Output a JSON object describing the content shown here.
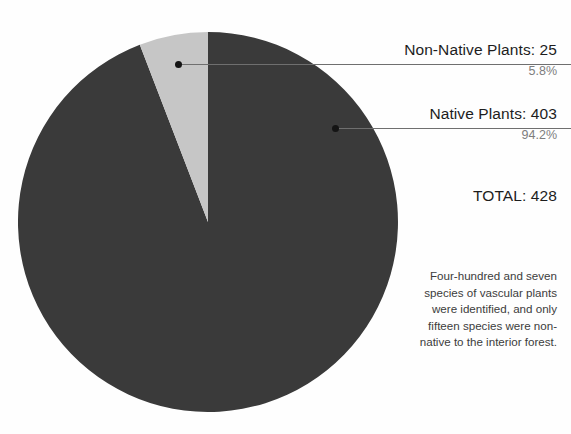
{
  "chart_data": {
    "type": "pie",
    "title": "",
    "categories": [
      "Non-Native Plants",
      "Native Plants"
    ],
    "values": [
      25,
      403
    ],
    "percentages": [
      "5.8%",
      "94.2%"
    ],
    "total": 428,
    "total_label": "TOTAL: 428",
    "colors": [
      "#c6c6c6",
      "#3a3a3a"
    ],
    "legend_position": "callout-right",
    "grid": false,
    "start_angle_deg": 0,
    "direction": "counterclockwise",
    "annotations": [
      "Four-hundred and seven species of vascular plants were identified, and only fifteen species were non-native to the interior forest."
    ],
    "slices": [
      {
        "label": "Non-Native Plants",
        "value": 25,
        "percent": 5.8,
        "percent_label": "5.8%",
        "label_with_value": "Non-Native Plants: 25",
        "color": "#c6c6c6"
      },
      {
        "label": "Native Plants",
        "value": 403,
        "percent": 94.2,
        "percent_label": "94.2%",
        "label_with_value": "Native Plants: 403",
        "color": "#3a3a3a"
      }
    ]
  },
  "callouts": {
    "non_native": {
      "title": "Non-Native Plants: 25",
      "percent": "5.8%"
    },
    "native": {
      "title": "Native Plants: 403",
      "percent": "94.2%"
    }
  },
  "total": {
    "label": "TOTAL: 428"
  },
  "note": {
    "text": "Four-hundred and seven species of vascular plants were identified, and only fifteen species were non-native to the interior forest."
  }
}
